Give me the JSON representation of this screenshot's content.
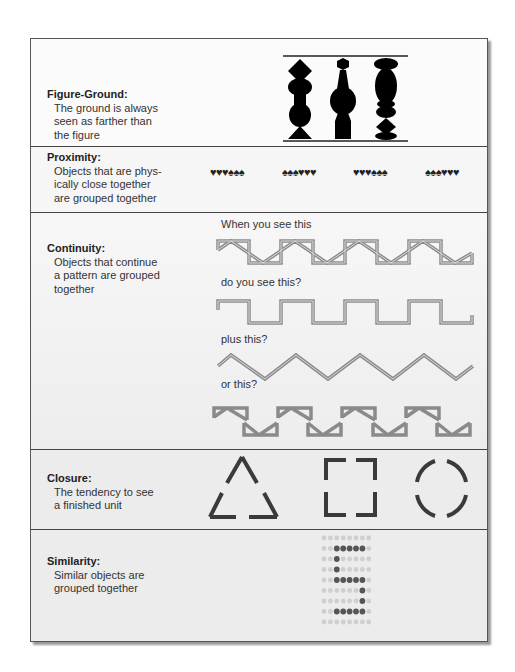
{
  "sections": [
    {
      "id": "figure-ground",
      "title": "Figure-Ground:",
      "description_lines": [
        "The ground is always",
        "seen as farther than",
        "the figure"
      ]
    },
    {
      "id": "proximity",
      "title": "Proximity:",
      "description_lines": [
        "Objects that are phys-",
        "ically close together",
        "are grouped together"
      ],
      "symbol_groups": [
        "♥♥♥♠♠♠",
        "♠♠♠♥♥♥",
        "♥♥♥♠♠♠",
        "♠♠♠♥♥♥"
      ]
    },
    {
      "id": "continuity",
      "title": "Continuity:",
      "description_lines": [
        "Objects that continue",
        "a pattern are grouped",
        "together"
      ],
      "captions": [
        "When you see this",
        "do you see this?",
        "plus this?",
        "or this?"
      ]
    },
    {
      "id": "closure",
      "title": "Closure:",
      "description_lines": [
        "The tendency to see",
        "a finished unit"
      ],
      "shapes": [
        "triangle",
        "square",
        "circle"
      ]
    },
    {
      "id": "similarity",
      "title": "Similarity:",
      "description_lines": [
        "Similar objects are",
        "grouped together"
      ],
      "dot_grid": [
        "00000000",
        "00111110",
        "00100000",
        "00100000",
        "00111110",
        "00000010",
        "00000010",
        "00111110",
        "00000000"
      ]
    }
  ],
  "colors": {
    "figure": "#000000",
    "pattern_stroke": "#7a7a7a",
    "pattern_light": "#d8d8d8",
    "closure_stroke": "#3a3a3a",
    "dot_dark": "#555555",
    "dot_light": "#cfcfcf"
  }
}
